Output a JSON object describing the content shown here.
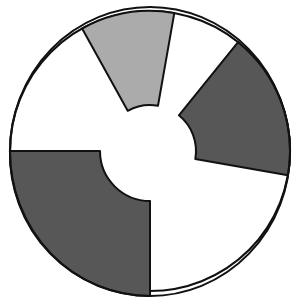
{
  "diagram": {
    "type": "segmented-ring",
    "colors": {
      "dark_fill": "#575757",
      "light_fill": "#ababab",
      "background_fill": "#ffffff",
      "stroke": "#111111"
    },
    "sectors": [
      {
        "name": "light-gray-sector",
        "fill": "light",
        "start_deg": 80,
        "end_deg": 119,
        "inner_radius": 46
      },
      {
        "name": "dark-right-sector",
        "fill": "dark",
        "start_deg": -10,
        "end_deg": 51,
        "inner_radius": 46
      },
      {
        "name": "dark-bottom-left-sector",
        "fill": "dark",
        "start_deg": 180,
        "end_deg": 270,
        "inner_radius": 50
      }
    ]
  }
}
